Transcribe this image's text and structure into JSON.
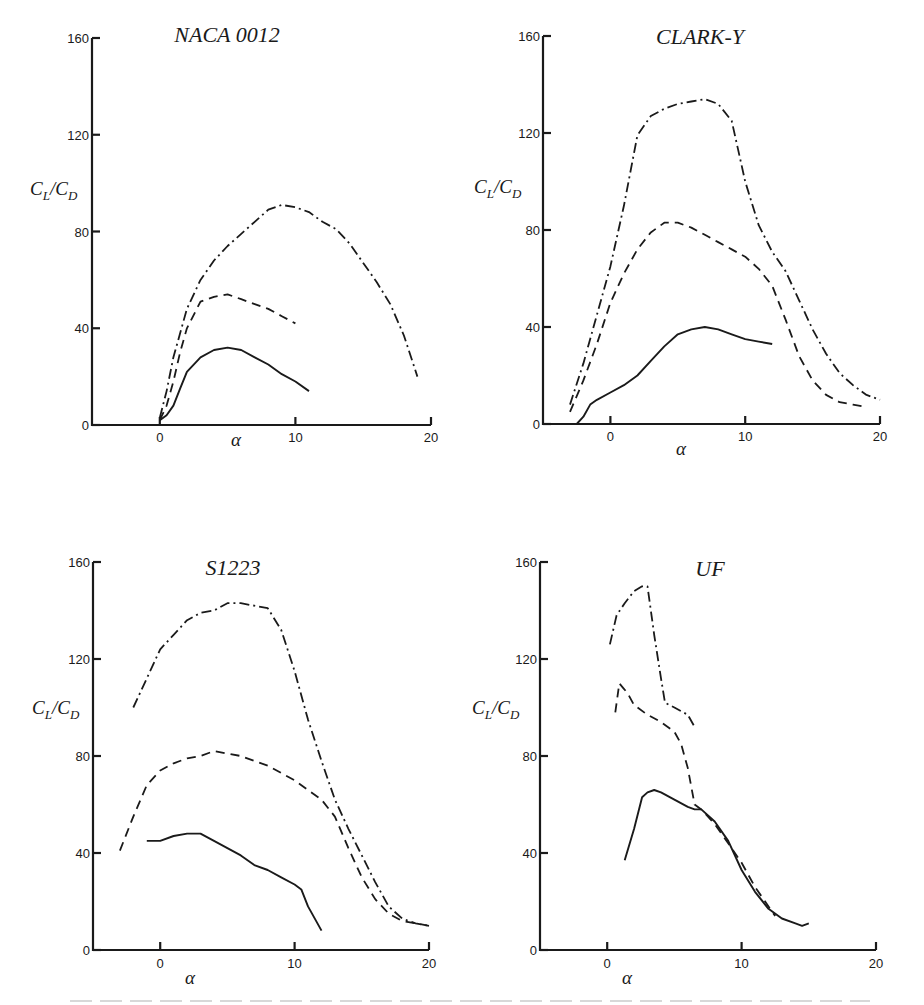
{
  "figure": {
    "ylabel_main": "C",
    "ylabel_sub1": "L",
    "ylabel_sep": "/C",
    "ylabel_sub2": "D",
    "xlabel": "α"
  },
  "chart_data": [
    {
      "type": "line",
      "title": "NACA 0012",
      "xlabel": "α",
      "ylabel": "CL/CD",
      "xlim": [
        -5,
        20
      ],
      "ylim": [
        0,
        160
      ],
      "xticks": [
        0,
        10,
        20
      ],
      "yticks": [
        0,
        40,
        80,
        120,
        160
      ],
      "grid": false,
      "legend": null,
      "series": [
        {
          "name": "solid",
          "style": "solid",
          "x": [
            0,
            0.5,
            1,
            1.5,
            2,
            3,
            4,
            5,
            6,
            7,
            8,
            9,
            10,
            11
          ],
          "y": [
            2,
            4,
            8,
            15,
            22,
            28,
            31,
            32,
            31,
            28,
            25,
            21,
            18,
            14
          ]
        },
        {
          "name": "dashed",
          "style": "dashed",
          "x": [
            0,
            0.5,
            1,
            1.5,
            2,
            3,
            4,
            5,
            6,
            7,
            8,
            9,
            10
          ],
          "y": [
            2,
            8,
            18,
            30,
            40,
            51,
            53,
            54,
            52,
            50,
            48,
            45,
            42
          ]
        },
        {
          "name": "dash-dot",
          "style": "dashdot",
          "x": [
            0,
            0.5,
            1,
            2,
            3,
            4,
            5,
            6,
            7,
            8,
            9,
            10,
            11,
            12,
            13,
            14,
            15,
            16,
            17,
            18,
            19
          ],
          "y": [
            3,
            14,
            28,
            48,
            60,
            68,
            74,
            79,
            84,
            89,
            91,
            90,
            88,
            84,
            81,
            75,
            67,
            59,
            50,
            37,
            20
          ]
        }
      ]
    },
    {
      "type": "line",
      "title": "CLARK-Y",
      "xlabel": "α",
      "ylabel": "CL/CD",
      "xlim": [
        -5,
        20
      ],
      "ylim": [
        0,
        160
      ],
      "xticks": [
        0,
        10,
        20
      ],
      "yticks": [
        0,
        40,
        80,
        120,
        160
      ],
      "grid": false,
      "legend": null,
      "series": [
        {
          "name": "solid",
          "style": "solid",
          "x": [
            -2.5,
            -2,
            -1.5,
            -1,
            0,
            1,
            2,
            3,
            4,
            5,
            6,
            7,
            8,
            9,
            10,
            11,
            12
          ],
          "y": [
            0,
            3,
            8,
            10,
            13,
            16,
            20,
            26,
            32,
            37,
            39,
            40,
            39,
            37,
            35,
            34,
            33
          ]
        },
        {
          "name": "dashed",
          "style": "dashed",
          "x": [
            -3,
            -2,
            -1,
            0,
            1,
            2,
            3,
            4,
            5,
            6,
            7,
            8,
            9,
            10,
            11,
            12,
            13,
            14,
            15,
            16,
            17,
            18,
            19
          ],
          "y": [
            5,
            18,
            33,
            50,
            62,
            72,
            79,
            83,
            83,
            81,
            78,
            75,
            72,
            69,
            64,
            57,
            43,
            28,
            18,
            12,
            9,
            8,
            7
          ]
        },
        {
          "name": "dash-dot",
          "style": "dashdot",
          "x": [
            -3,
            -2,
            -1,
            0,
            1,
            2,
            3,
            4,
            5,
            6,
            7,
            8,
            9,
            10,
            11,
            12,
            13,
            14,
            15,
            16,
            17,
            18,
            19,
            20
          ],
          "y": [
            8,
            25,
            45,
            65,
            90,
            119,
            127,
            130,
            132,
            133,
            134,
            132,
            125,
            100,
            82,
            71,
            63,
            51,
            39,
            29,
            21,
            16,
            12,
            10
          ]
        }
      ]
    },
    {
      "type": "line",
      "title": "S1223",
      "xlabel": "α",
      "ylabel": "CL/CD",
      "xlim": [
        -5,
        20
      ],
      "ylim": [
        0,
        160
      ],
      "xticks": [
        0,
        10,
        20
      ],
      "yticks": [
        0,
        40,
        80,
        120,
        160
      ],
      "grid": false,
      "legend": null,
      "series": [
        {
          "name": "solid",
          "style": "solid",
          "x": [
            -1,
            0,
            1,
            2,
            3,
            4,
            5,
            6,
            7,
            8,
            9,
            10,
            10.5,
            11,
            12
          ],
          "y": [
            45,
            45,
            47,
            48,
            48,
            45,
            42,
            39,
            35,
            33,
            30,
            27,
            25,
            18,
            8
          ]
        },
        {
          "name": "dashed",
          "style": "dashed",
          "x": [
            -3,
            -2,
            -1,
            0,
            1,
            2,
            3,
            4,
            5,
            6,
            7,
            8,
            9,
            10,
            11,
            12,
            13,
            14,
            15,
            16,
            17,
            18,
            19,
            20
          ],
          "y": [
            41,
            55,
            68,
            74,
            77,
            79,
            80,
            82,
            81,
            80,
            78,
            76,
            73,
            70,
            66,
            62,
            55,
            42,
            30,
            21,
            15,
            12,
            11,
            10
          ]
        },
        {
          "name": "dash-dot",
          "style": "dashdot",
          "x": [
            -2,
            -1,
            0,
            1,
            2,
            3,
            4,
            5,
            6,
            7,
            8,
            9,
            10,
            11,
            12,
            13,
            14,
            15,
            16,
            17,
            18,
            19,
            20
          ],
          "y": [
            100,
            112,
            124,
            130,
            136,
            139,
            140,
            143,
            143,
            142,
            141,
            132,
            115,
            95,
            78,
            62,
            50,
            39,
            28,
            18,
            13,
            11,
            10
          ]
        }
      ]
    },
    {
      "type": "line",
      "title": "UF",
      "xlabel": "α",
      "ylabel": "CL/CD",
      "xlim": [
        -5,
        20
      ],
      "ylim": [
        0,
        160
      ],
      "xticks": [
        0,
        10,
        20
      ],
      "yticks": [
        0,
        40,
        80,
        120,
        160
      ],
      "grid": false,
      "legend": null,
      "series": [
        {
          "name": "solid",
          "style": "solid",
          "x": [
            1.3,
            2,
            2.6,
            3,
            3.5,
            4,
            5,
            6,
            6.5,
            7,
            8,
            9,
            10,
            11,
            12,
            13,
            14,
            14.5,
            15
          ],
          "y": [
            37,
            50,
            63,
            65,
            66,
            65,
            62,
            59,
            58,
            58,
            53,
            45,
            33,
            24,
            17,
            13,
            11,
            10,
            11
          ]
        },
        {
          "name": "dashed",
          "style": "dashed",
          "x": [
            0.6,
            0.9,
            1.2,
            1.5,
            2,
            3,
            4,
            5,
            5.5,
            6,
            6.5,
            7,
            8,
            9,
            10,
            11,
            12.5
          ],
          "y": [
            98,
            110,
            108,
            106,
            101,
            97,
            94,
            90,
            85,
            75,
            60,
            58,
            52,
            44,
            36,
            26,
            14
          ]
        },
        {
          "name": "dash-dot",
          "style": "dashdot",
          "x": [
            0.2,
            0.7,
            1.3,
            2,
            2.6,
            3,
            3.5,
            4,
            4.3,
            5,
            6,
            6.5
          ],
          "y": [
            126,
            138,
            143,
            148,
            150,
            150,
            130,
            112,
            102,
            100,
            97,
            92
          ]
        }
      ]
    }
  ]
}
